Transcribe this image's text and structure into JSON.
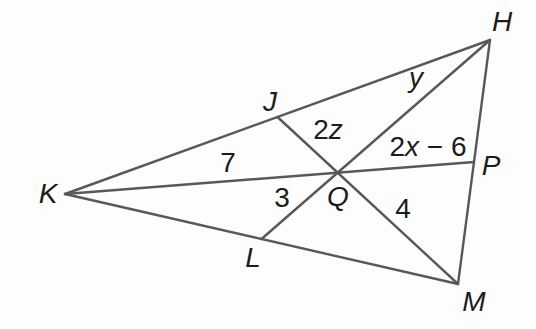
{
  "figure": {
    "colors": {
      "line": "#585858",
      "ink": "#1c1c1c",
      "background": "#fdfdfd"
    },
    "points": {
      "K": "K",
      "H": "H",
      "M": "M",
      "J": "J",
      "L": "L",
      "P": "P",
      "Q": "Q"
    },
    "segment_labels": {
      "KQ": {
        "num": "7"
      },
      "QP": {
        "num": "2",
        "var": "x",
        "rest": " − 6"
      },
      "HQ": {
        "var": "y"
      },
      "JQ": {
        "num": "2",
        "var": "z"
      },
      "QL": {
        "num": "3"
      },
      "QM": {
        "num": "4"
      }
    }
  }
}
